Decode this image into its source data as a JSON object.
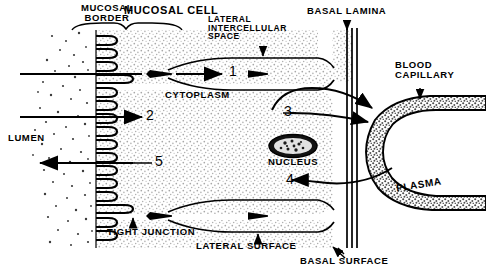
{
  "figure": {
    "type": "biological-schematic"
  },
  "labels": {
    "mucosal_border": "MUCOSAL\nBORDER",
    "mucosal_cell": "MUCOSAL CELL",
    "lateral_intercellular_space": "LATERAL\nINTERCELLULAR\nSPACE",
    "basal_lamina": "BASAL LAMINA",
    "blood_capillary": "BLOOD\nCAPILLARY",
    "cytoplasm": "CYTOPLASM",
    "lumen": "LUMEN",
    "nucleus": "NUCLEUS",
    "plasma": "PLASMA",
    "tight_junction": "TIGHT JUNCTION",
    "lateral_surface": "LATERAL SURFACE",
    "basal_surface": "BASAL SURFACE"
  },
  "pathways": [
    {
      "id": "1",
      "label": "1",
      "direction": "right",
      "description": "transport into lateral intercellular space"
    },
    {
      "id": "2",
      "label": "2",
      "direction": "right",
      "description": "absorption across mucosal border into cytoplasm"
    },
    {
      "id": "3",
      "label": "3",
      "direction": "right",
      "description": "transport from cytoplasm across basal lamina into capillary"
    },
    {
      "id": "4",
      "label": "4",
      "direction": "left",
      "description": "transport from plasma into cytoplasm"
    },
    {
      "id": "5",
      "label": "5",
      "direction": "left",
      "description": "secretion from cytoplasm into lumen"
    }
  ],
  "colors": {
    "ink": "#000000",
    "background": "#ffffff",
    "cytoplasm_stipple": "#bdbdbd",
    "capillary_wall_stipple": "#8a8a8a"
  },
  "structure": {
    "microvilli_count": 19,
    "basal_lamina_lines": 3,
    "tight_junctions": 2
  }
}
